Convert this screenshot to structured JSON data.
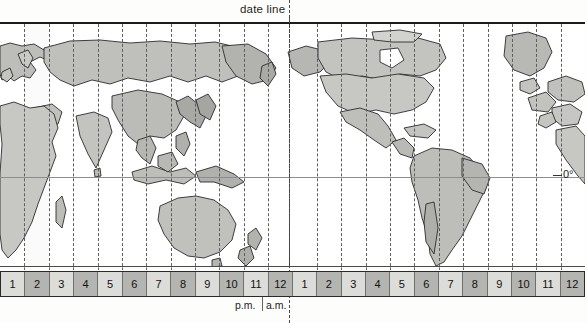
{
  "figure": {
    "title_label": "date line",
    "equator_label": "0°",
    "pm_label": "p.m.",
    "am_label": "a.m.",
    "map_kind": "world-time-zone-map",
    "projection_center": "pacific-centered",
    "colors": {
      "land_light": "#c9c9c5",
      "land_dark": "#a6a6a2",
      "ocean": "#ffffff",
      "outline": "#2b2b2b",
      "zone_line": "#5d5d5d",
      "frame": "#1c1c1c",
      "strip_light": "#dcdcd8",
      "strip_dark": "#b4b4b0",
      "text": "#1d1d1d"
    }
  },
  "chart_data": {
    "type": "table",
    "title": "date line",
    "xlabel": "",
    "ylabel": "",
    "grid": true,
    "legend_position": "none",
    "annotations": [
      "date line",
      "0°",
      "p.m.",
      "a.m."
    ],
    "categories": [
      "1",
      "2",
      "3",
      "4",
      "5",
      "6",
      "7",
      "8",
      "9",
      "10",
      "11",
      "12",
      "1",
      "2",
      "3",
      "4",
      "5",
      "6",
      "7",
      "8",
      "9",
      "10",
      "11",
      "12"
    ],
    "series": [
      {
        "name": "hour cell shade",
        "values": [
          "light",
          "dark",
          "light",
          "dark",
          "light",
          "dark",
          "light",
          "dark",
          "light",
          "dark",
          "light",
          "dark",
          "light",
          "dark",
          "light",
          "dark",
          "light",
          "dark",
          "light",
          "dark",
          "light",
          "dark",
          "light",
          "dark"
        ]
      },
      {
        "name": "half of day",
        "values": [
          "p.m.",
          "p.m.",
          "p.m.",
          "p.m.",
          "p.m.",
          "p.m.",
          "p.m.",
          "p.m.",
          "p.m.",
          "p.m.",
          "p.m.",
          "p.m.",
          "a.m.",
          "a.m.",
          "a.m.",
          "a.m.",
          "a.m.",
          "a.m.",
          "a.m.",
          "a.m.",
          "a.m.",
          "a.m.",
          "a.m.",
          "a.m."
        ]
      }
    ],
    "zone_count": 24,
    "date_line_position_index": 12
  },
  "hour_strip": {
    "cells": [
      {
        "label": "1",
        "shade": "light",
        "half": "p.m."
      },
      {
        "label": "2",
        "shade": "dark",
        "half": "p.m."
      },
      {
        "label": "3",
        "shade": "light",
        "half": "p.m."
      },
      {
        "label": "4",
        "shade": "dark",
        "half": "p.m."
      },
      {
        "label": "5",
        "shade": "light",
        "half": "p.m."
      },
      {
        "label": "6",
        "shade": "dark",
        "half": "p.m."
      },
      {
        "label": "7",
        "shade": "light",
        "half": "p.m."
      },
      {
        "label": "8",
        "shade": "dark",
        "half": "p.m."
      },
      {
        "label": "9",
        "shade": "light",
        "half": "p.m."
      },
      {
        "label": "10",
        "shade": "dark",
        "half": "p.m."
      },
      {
        "label": "11",
        "shade": "light",
        "half": "p.m."
      },
      {
        "label": "12",
        "shade": "dark",
        "half": "p.m."
      },
      {
        "label": "1",
        "shade": "light",
        "half": "a.m."
      },
      {
        "label": "2",
        "shade": "dark",
        "half": "a.m."
      },
      {
        "label": "3",
        "shade": "light",
        "half": "a.m."
      },
      {
        "label": "4",
        "shade": "dark",
        "half": "a.m."
      },
      {
        "label": "5",
        "shade": "light",
        "half": "a.m."
      },
      {
        "label": "6",
        "shade": "dark",
        "half": "a.m."
      },
      {
        "label": "7",
        "shade": "light",
        "half": "a.m."
      },
      {
        "label": "8",
        "shade": "dark",
        "half": "a.m."
      },
      {
        "label": "9",
        "shade": "light",
        "half": "a.m."
      },
      {
        "label": "10",
        "shade": "dark",
        "half": "a.m."
      },
      {
        "label": "11",
        "shade": "light",
        "half": "a.m."
      },
      {
        "label": "12",
        "shade": "dark",
        "half": "a.m."
      }
    ]
  },
  "landmasses": [
    {
      "name": "africa",
      "shade": "light"
    },
    {
      "name": "europe",
      "shade": "light"
    },
    {
      "name": "asia-russia",
      "shade": "light"
    },
    {
      "name": "india",
      "shade": "light"
    },
    {
      "name": "china-southeast-asia",
      "shade": "light"
    },
    {
      "name": "indonesia",
      "shade": "light"
    },
    {
      "name": "australia",
      "shade": "light"
    },
    {
      "name": "new-zealand",
      "shade": "light"
    },
    {
      "name": "papua-new-guinea",
      "shade": "light"
    },
    {
      "name": "alaska",
      "shade": "light"
    },
    {
      "name": "canada",
      "shade": "light"
    },
    {
      "name": "united-states",
      "shade": "light"
    },
    {
      "name": "mexico-central-america",
      "shade": "light"
    },
    {
      "name": "south-america",
      "shade": "light"
    },
    {
      "name": "greenland",
      "shade": "light"
    },
    {
      "name": "iceland",
      "shade": "light"
    },
    {
      "name": "madagascar",
      "shade": "light"
    },
    {
      "name": "japan",
      "shade": "light"
    },
    {
      "name": "western-europe-right-edge",
      "shade": "light"
    }
  ]
}
